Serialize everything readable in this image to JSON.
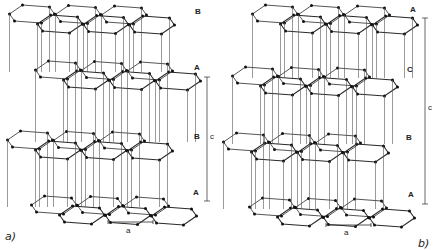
{
  "figure": {
    "panels": [
      {
        "id": "a",
        "caption": "a)",
        "caption_pos": [
          5,
          231
        ],
        "stacking": "ABAB (hexagonal graphite)",
        "layers": [
          {
            "label": "B",
            "y": 22,
            "x0": 10,
            "label_pos": [
              195,
              8
            ]
          },
          {
            "label": "A",
            "y": 78,
            "x0": 36,
            "label_pos": [
              194,
              64
            ]
          },
          {
            "label": "B",
            "y": 148,
            "x0": 8,
            "label_pos": [
              194,
              133
            ]
          },
          {
            "label": "A",
            "y": 213,
            "x0": 32,
            "label_pos": [
              193,
              189
            ]
          }
        ],
        "c_bar": {
          "x": 207,
          "y1": 77,
          "y2": 201,
          "label": "c",
          "label_pos": [
            210,
            133
          ]
        },
        "a_bar": {
          "x1": 108,
          "x2": 153,
          "y": 222,
          "label": "a",
          "label_pos": [
            126,
            227
          ]
        }
      },
      {
        "id": "b",
        "caption": "b)",
        "caption_pos": [
          418,
          238
        ],
        "stacking": "ABCA (rhombohedral graphite)",
        "layers": [
          {
            "label": "A",
            "y": 22,
            "x0": 253,
            "label_pos": [
              410,
              6
            ]
          },
          {
            "label": "C",
            "y": 84,
            "x0": 233,
            "label_pos": [
              407,
              66
            ]
          },
          {
            "label": "B",
            "y": 150,
            "x0": 224,
            "label_pos": [
              406,
              134
            ]
          },
          {
            "label": "A",
            "y": 215,
            "x0": 250,
            "label_pos": [
              408,
              191
            ]
          }
        ],
        "c_bar": {
          "x": 425,
          "y1": 18,
          "y2": 204,
          "label": "c",
          "label_pos": [
            428,
            104
          ]
        },
        "a_bar": {
          "x1": 326,
          "x2": 371,
          "y": 225,
          "label": "a",
          "label_pos": [
            344,
            229
          ]
        }
      }
    ],
    "colors": {
      "line": "#2a2a2a",
      "atom": "#111111",
      "bond_back": "#555555",
      "background": "#ffffff"
    }
  }
}
